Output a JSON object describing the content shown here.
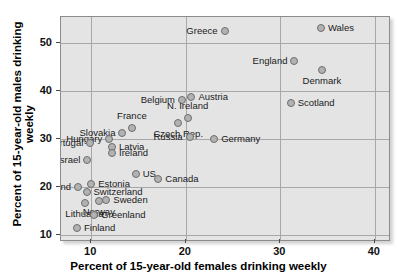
{
  "chart_data": {
    "type": "scatter",
    "title": "",
    "xlabel": "Percent of 15-year-old females drinking weekly",
    "ylabel": "Percent of 15-year-old males drinking weekly",
    "xlim": [
      6.8,
      41.5
    ],
    "ylim": [
      9.0,
      55.5
    ],
    "xticks": [
      10,
      20,
      30,
      40
    ],
    "yticks": [
      10,
      20,
      30,
      40,
      50
    ],
    "grid": true,
    "legend": "none",
    "points": [
      {
        "label": "Wales",
        "x": 34.3,
        "y": 53.2,
        "label_pos": "r"
      },
      {
        "label": "Greece",
        "x": 24.1,
        "y": 52.6,
        "label_pos": "l"
      },
      {
        "label": "England",
        "x": 31.5,
        "y": 46.4,
        "label_pos": "l"
      },
      {
        "label": "Denmark",
        "x": 34.4,
        "y": 44.5,
        "label_pos": "b"
      },
      {
        "label": "Scotland",
        "x": 31.1,
        "y": 37.6,
        "label_pos": "r"
      },
      {
        "label": "Austria",
        "x": 20.6,
        "y": 38.9,
        "label_pos": "r"
      },
      {
        "label": "Belgium",
        "x": 19.6,
        "y": 38.2,
        "label_pos": "l"
      },
      {
        "label": "N. Ireland",
        "x": 20.2,
        "y": 34.4,
        "label_pos": "t"
      },
      {
        "label": "Czech Rep.",
        "x": 19.2,
        "y": 33.5,
        "label_pos": "b"
      },
      {
        "label": "Russia",
        "x": 20.4,
        "y": 30.4,
        "label_pos": "l"
      },
      {
        "label": "Germany",
        "x": 23.0,
        "y": 30.0,
        "label_pos": "r"
      },
      {
        "label": "France",
        "x": 14.3,
        "y": 32.3,
        "label_pos": "t"
      },
      {
        "label": "Slovakia",
        "x": 13.3,
        "y": 31.4,
        "label_pos": "l"
      },
      {
        "label": "Hungary",
        "x": 11.9,
        "y": 30.1,
        "label_pos": "l"
      },
      {
        "label": "Latvia",
        "x": 12.2,
        "y": 28.3,
        "label_pos": "r"
      },
      {
        "label": "Ireland",
        "x": 12.2,
        "y": 27.2,
        "label_pos": "r"
      },
      {
        "label": "Portugal",
        "x": 9.9,
        "y": 29.3,
        "label_pos": "l"
      },
      {
        "label": "Israel",
        "x": 9.6,
        "y": 25.7,
        "label_pos": "l"
      },
      {
        "label": "US",
        "x": 14.7,
        "y": 22.7,
        "label_pos": "r"
      },
      {
        "label": "Canada",
        "x": 17.1,
        "y": 21.7,
        "label_pos": "r"
      },
      {
        "label": "Estonia",
        "x": 10.0,
        "y": 20.7,
        "label_pos": "r"
      },
      {
        "label": "Poland",
        "x": 8.6,
        "y": 20.0,
        "label_pos": "l"
      },
      {
        "label": "Switzerland",
        "x": 9.5,
        "y": 19.0,
        "label_pos": "r"
      },
      {
        "label": "Sweden",
        "x": 11.6,
        "y": 17.4,
        "label_pos": "r"
      },
      {
        "label": "Norway",
        "x": 10.8,
        "y": 17.2,
        "label_pos": "b"
      },
      {
        "label": "Lithuania",
        "x": 9.3,
        "y": 16.8,
        "label_pos": "b"
      },
      {
        "label": "Greenland",
        "x": 10.3,
        "y": 14.2,
        "label_pos": "r"
      },
      {
        "label": "Finland",
        "x": 8.5,
        "y": 11.6,
        "label_pos": "r"
      }
    ]
  },
  "colors": {
    "plot_background": "#e4e4e4",
    "marker_fill": "#b2b2b2",
    "marker_edge": "#6e6e6e",
    "gridline": "#a8a8a8",
    "frame": "#8c8c8c",
    "text": "#111111"
  }
}
